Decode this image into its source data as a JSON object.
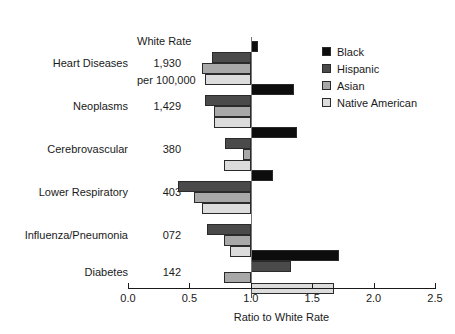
{
  "header": {
    "rate_column_title_line1": "White Rate",
    "rate_column_title_line2": "per 100,000"
  },
  "legend": {
    "position": "top-right",
    "entries": [
      {
        "label": "Black",
        "color": "#0d0d0d"
      },
      {
        "label": "Hispanic",
        "color": "#4a4a4a"
      },
      {
        "label": "Asian",
        "color": "#a8a8a8"
      },
      {
        "label": "Native American",
        "color": "#dcdcdc"
      }
    ]
  },
  "chart_data": {
    "type": "bar",
    "orientation": "horizontal",
    "title": "",
    "xlabel": "Ratio to White Rate",
    "ylabel": "",
    "xlim": [
      0.0,
      2.5
    ],
    "xticks": [
      "0.0",
      "0.5",
      "1.0",
      "1.5",
      "2.0",
      "2.5"
    ],
    "xtick_values": [
      0.0,
      0.5,
      1.0,
      1.5,
      2.0,
      2.5
    ],
    "baseline": 1.0,
    "grid": false,
    "categories": [
      "Heart Diseases",
      "Neoplasms",
      "Cerebrovascular",
      "Lower Respiratory",
      "Influenza/Pneumonia",
      "Diabetes"
    ],
    "annotations": {
      "column_header": "White Rate per 100,000",
      "white_rate_per_100000": [
        "1,930",
        "1,429",
        "380",
        "403",
        "072",
        "142"
      ]
    },
    "series": [
      {
        "name": "Black",
        "color": "#0d0d0d",
        "values": [
          1.06,
          1.35,
          1.38,
          1.18,
          1.0,
          1.72
        ]
      },
      {
        "name": "Hispanic",
        "color": "#4a4a4a",
        "values": [
          0.68,
          0.63,
          0.79,
          0.41,
          0.64,
          1.33
        ]
      },
      {
        "name": "Asian",
        "color": "#a8a8a8",
        "values": [
          0.6,
          0.7,
          0.94,
          0.54,
          0.78,
          0.78
        ]
      },
      {
        "name": "Native American",
        "color": "#dcdcdc",
        "values": [
          0.63,
          0.7,
          0.78,
          0.6,
          0.83,
          1.68
        ]
      }
    ]
  }
}
